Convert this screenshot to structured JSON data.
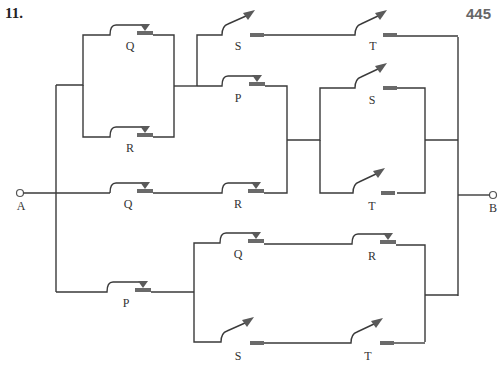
{
  "header": {
    "problem_number": "11.",
    "page_number": "445"
  },
  "terminals": {
    "input": "A",
    "output": "B"
  },
  "switches": {
    "block1_top": {
      "label": "Q",
      "type": "normally-closed"
    },
    "block1_bottom": {
      "label": "R",
      "type": "normally-closed"
    },
    "upper_s": {
      "label": "S",
      "type": "normally-open"
    },
    "upper_t": {
      "label": "T",
      "type": "normally-open"
    },
    "upper_p": {
      "label": "P",
      "type": "normally-closed"
    },
    "mid_q": {
      "label": "Q",
      "type": "normally-closed"
    },
    "mid_r": {
      "label": "R",
      "type": "normally-closed"
    },
    "par_s": {
      "label": "S",
      "type": "normally-open"
    },
    "par_t": {
      "label": "T",
      "type": "normally-open"
    },
    "low_p": {
      "label": "P",
      "type": "normally-closed"
    },
    "low_q": {
      "label": "Q",
      "type": "normally-closed"
    },
    "low_r": {
      "label": "R",
      "type": "normally-closed"
    },
    "low_s": {
      "label": "S",
      "type": "normally-open"
    },
    "low_t": {
      "label": "T",
      "type": "normally-open"
    }
  },
  "colors": {
    "wire": "#3a3a3a",
    "contact": "#6a6a6a",
    "page_number": "#666666"
  }
}
